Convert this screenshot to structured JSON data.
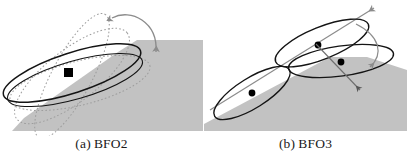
{
  "figure": {
    "width": 407,
    "height": 161,
    "background_color": "#ffffff",
    "panels": [
      {
        "id": "panel-a",
        "caption_label": "(a)",
        "caption_name": "BFO2",
        "caption_full": "(a) BFO2",
        "description": "Single tilted disc (ellipse) resting on a shaded ground plane, with dotted outlines showing alternate rotated orientations and a curved double-headed arrow indicating tilt rotation.",
        "ground_plane_color": "#c2c2c2",
        "solid_ellipse_color": "#141414",
        "ghost_ellipse_color": "#9a9a9a",
        "ghost_ellipse_style": "dotted",
        "marker_color": "#000000",
        "marker_shape": "square",
        "arrow_color": "#8c8c8c",
        "arrow_heads": 2,
        "disc_count_solid": 1,
        "disc_count_ghost": 3
      },
      {
        "id": "panel-b",
        "caption_label": "(b)",
        "caption_name": "BFO3",
        "caption_full": "(b) BFO3",
        "description": "Three discs (ellipses) arranged along an inclined slope: one lower-left on the slope and two overlapping near the top, joined by an axis line with arrowheads and a curved arrow showing rotation between the upper pair.",
        "ground_plane_color": "#c2c2c2",
        "solid_ellipse_color": "#141414",
        "marker_color": "#000000",
        "marker_shape": "circle",
        "axis_line_color": "#8c8c8c",
        "curved_arrow_color": "#8c8c8c",
        "disc_count_solid": 3
      }
    ]
  }
}
